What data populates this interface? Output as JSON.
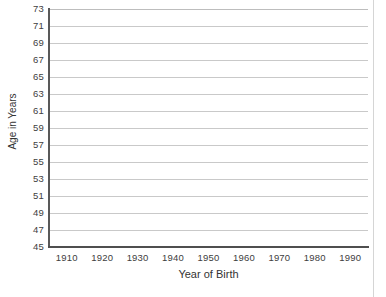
{
  "chart_data": {
    "type": "line",
    "title": "",
    "subtitle": "",
    "xlabel": "Year of Birth",
    "ylabel": "Age in Years",
    "xlim": [
      1905,
      1995
    ],
    "ylim": [
      45,
      73
    ],
    "x_ticks": [
      1910,
      1920,
      1930,
      1940,
      1950,
      1960,
      1970,
      1980,
      1990
    ],
    "y_ticks": [
      73,
      71,
      69,
      67,
      65,
      63,
      61,
      59,
      57,
      55,
      53,
      51,
      49,
      47,
      45
    ],
    "grid": "horizontal",
    "legend": "none",
    "series": [],
    "values": [],
    "annotations": [],
    "note": "Empty plot grid: axes and gridlines drawn, no data series plotted"
  },
  "axes": {
    "y_title": "Age in Years",
    "x_title": "Year of Birth",
    "y_tick_labels": [
      "73",
      "71",
      "69",
      "67",
      "65",
      "63",
      "61",
      "59",
      "57",
      "55",
      "53",
      "51",
      "49",
      "47",
      "45"
    ],
    "x_tick_labels": [
      "1910",
      "1920",
      "1930",
      "1940",
      "1950",
      "1960",
      "1970",
      "1980",
      "1990"
    ]
  },
  "colors": {
    "gridline": "#c9c9c9",
    "axis_line": "#4f4f4f",
    "text": "#404040",
    "background": "#ffffff"
  }
}
